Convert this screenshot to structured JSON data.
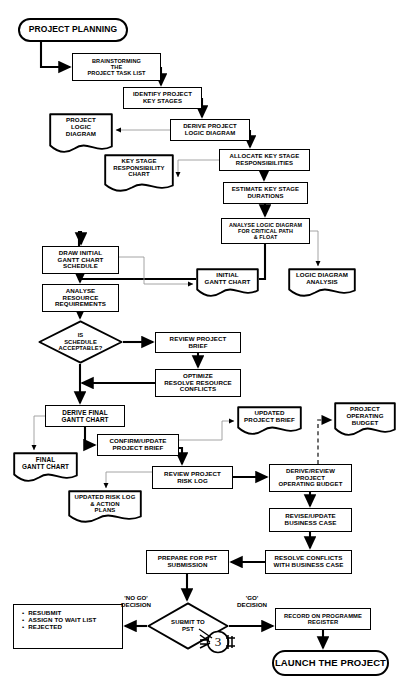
{
  "diagram": {
    "title": "PROJECT PLANNING",
    "type": "flowchart",
    "page_marker": "3",
    "header_faint": ""
  },
  "nodes": [
    {
      "id": "project-planning",
      "shape": "terminator",
      "label": "PROJECT PLANNING",
      "x": 18,
      "y": 18,
      "w": 110,
      "h": 24,
      "fs": 8.5
    },
    {
      "id": "brainstorming",
      "shape": "process",
      "label": "BRAINSTORMING\nTHE\nPROJECT TASK LIST",
      "x": 72,
      "y": 53,
      "w": 89,
      "h": 28,
      "fs": 5.6
    },
    {
      "id": "identify-key-stages",
      "shape": "process",
      "label": "IDENTIFY PROJECT\nKEY STAGES",
      "x": 123,
      "y": 87,
      "w": 79,
      "h": 22,
      "fs": 6.0
    },
    {
      "id": "derive-logic-diagram",
      "shape": "process",
      "label": "DERIVE PROJECT\nLOGIC DIAGRAM",
      "x": 170,
      "y": 119,
      "w": 80,
      "h": 22,
      "fs": 6.0
    },
    {
      "id": "project-logic-diagram",
      "shape": "document",
      "label": "PROJECT\nLOGIC\nDIAGRAM",
      "x": 49,
      "y": 113,
      "w": 64,
      "h": 44,
      "fs": 6.2
    },
    {
      "id": "allocate-responsibility",
      "shape": "process",
      "label": "ALLOCATE KEY STAGE\nRESPONSIBILITIES",
      "x": 219,
      "y": 149,
      "w": 91,
      "h": 22,
      "fs": 6.0
    },
    {
      "id": "key-stage-resp-chart",
      "shape": "document",
      "label": "KEY STAGE\nRESPONSIBILITY\nCHART",
      "x": 104,
      "y": 154,
      "w": 70,
      "h": 42,
      "fs": 6.0
    },
    {
      "id": "estimate-durations",
      "shape": "process",
      "label": "ESTIMATE KEY STAGE\nDURATIONS",
      "x": 223,
      "y": 182,
      "w": 85,
      "h": 22,
      "fs": 6.0
    },
    {
      "id": "analyse-logic-diagram",
      "shape": "process",
      "label": "ANALYSE LOGIC DIAGRAM\nFOR CRITICAL PATH\n&  FLOAT",
      "x": 221,
      "y": 218,
      "w": 89,
      "h": 26,
      "fs": 5.4
    },
    {
      "id": "draw-initial-gantt",
      "shape": "process",
      "label": "DRAW  INITIAL\nGANTT CHART\nSCHEDULE",
      "x": 42,
      "y": 246,
      "w": 77,
      "h": 28,
      "fs": 6.2
    },
    {
      "id": "analyse-resource-req",
      "shape": "process",
      "label": "ANALYSE\nRESOURCE\nREQUIREMENTS",
      "x": 42,
      "y": 284,
      "w": 77,
      "h": 28,
      "fs": 6.2
    },
    {
      "id": "initial-gantt-chart",
      "shape": "document",
      "label": "INITIAL\nGANTT CHART",
      "x": 196,
      "y": 268,
      "w": 63,
      "h": 33,
      "fs": 6.2
    },
    {
      "id": "logic-diagram-analysis",
      "shape": "document",
      "label": "LOGIC DIAGRAM\nANALYSIS",
      "x": 288,
      "y": 268,
      "w": 68,
      "h": 33,
      "fs": 6.2
    },
    {
      "id": "is-schedule-acceptable",
      "shape": "decision",
      "label": "IS\nSCHEDULE\nACCEPTABLE?",
      "x": 38,
      "y": 320,
      "w": 85,
      "h": 44,
      "fs": 5.8
    },
    {
      "id": "review-project-brief",
      "shape": "process",
      "label": "REVIEW PROJECT\nBRIEF",
      "x": 155,
      "y": 332,
      "w": 86,
      "h": 21,
      "fs": 6.2
    },
    {
      "id": "optimize-resolve",
      "shape": "process",
      "label": "OPTIMIZE\nRESOLVE RESOURCE\nCONFLICTS",
      "x": 155,
      "y": 369,
      "w": 86,
      "h": 28,
      "fs": 6.2
    },
    {
      "id": "derive-final-gantt",
      "shape": "process",
      "label": "DERIVE  FINAL\nGANTT CHART",
      "x": 45,
      "y": 405,
      "w": 80,
      "h": 22,
      "fs": 6.4
    },
    {
      "id": "final-gantt-chart",
      "shape": "document",
      "label": "FINAL\nGANTT CHART",
      "x": 13,
      "y": 452,
      "w": 65,
      "h": 34,
      "fs": 6.4
    },
    {
      "id": "confirm-update-brief",
      "shape": "process",
      "label": "CONFIRM/UPDATE\nPROJECT  BRIEF",
      "x": 97,
      "y": 434,
      "w": 82,
      "h": 22,
      "fs": 6.2
    },
    {
      "id": "updated-project-brief",
      "shape": "document",
      "label": "UPDATED\nPROJECT BRIEF",
      "x": 237,
      "y": 406,
      "w": 65,
      "h": 33,
      "fs": 6.2
    },
    {
      "id": "project-operating-budget",
      "shape": "document",
      "label": "PROJECT\nOPERATING\nBUDGET",
      "x": 334,
      "y": 402,
      "w": 62,
      "h": 38,
      "fs": 6.2
    },
    {
      "id": "review-risk-log",
      "shape": "process",
      "label": "REVIEW PROJECT\nRISK LOG",
      "x": 152,
      "y": 466,
      "w": 81,
      "h": 23,
      "fs": 6.2
    },
    {
      "id": "updated-risk-log",
      "shape": "document",
      "label": "UPDATED RISK LOG\n& ACTION\nPLANS",
      "x": 68,
      "y": 490,
      "w": 74,
      "h": 37,
      "fs": 6.0
    },
    {
      "id": "derive-review-budget",
      "shape": "process",
      "label": "DERIVE/REVIEW\nPROJECT\nOPERATING BUDGET",
      "x": 269,
      "y": 464,
      "w": 83,
      "h": 28,
      "fs": 6.0
    },
    {
      "id": "revise-business-case",
      "shape": "process",
      "label": "REVISE/UPDATE\nBUSINESS CASE",
      "x": 269,
      "y": 508,
      "w": 83,
      "h": 24,
      "fs": 6.2
    },
    {
      "id": "resolve-conflicts",
      "shape": "process",
      "label": "RESOLVE CONFLICTS\nWITH BUSINESS CASE",
      "x": 265,
      "y": 550,
      "w": 87,
      "h": 24,
      "fs": 6.2
    },
    {
      "id": "prepare-pst-submission",
      "shape": "process",
      "label": "PREPARE FOR PST\nSUBMISSION",
      "x": 146,
      "y": 550,
      "w": 83,
      "h": 24,
      "fs": 6.2
    },
    {
      "id": "submit-to-pst",
      "shape": "decision",
      "label": "SUBMIT TO\nPST",
      "x": 147,
      "y": 602,
      "w": 82,
      "h": 48,
      "fs": 6.0
    },
    {
      "id": "record-on-register",
      "shape": "process",
      "label": "RECORD ON PROGRAMME\nREGISTER",
      "x": 275,
      "y": 608,
      "w": 96,
      "h": 22,
      "fs": 5.8
    },
    {
      "id": "launch-the-project",
      "shape": "terminator",
      "label": "LAUNCH THE PROJECT",
      "x": 272,
      "y": 650,
      "w": 117,
      "h": 26,
      "fs": 9.5
    }
  ],
  "list_node": {
    "id": "no-go-outcomes",
    "x": 13,
    "y": 604,
    "w": 110,
    "h": 45,
    "fs": 6.2,
    "items": [
      "RESUBMIT",
      "ASSIGN TO WAIT LIST",
      "REJECTED"
    ]
  },
  "edge_labels": [
    {
      "id": "no-go-decision",
      "text": "'NO GO'\nDECISION",
      "x": 113,
      "y": 594,
      "w": 46,
      "fs": 6.2
    },
    {
      "id": "go-decision",
      "text": "'GO'\nDECISION",
      "x": 230,
      "y": 594,
      "w": 44,
      "fs": 6.2
    }
  ],
  "page_marker": {
    "id": "page-connector-3",
    "value": "3",
    "x": 198,
    "y": 627,
    "w": 40,
    "h": 30,
    "fs": 13
  },
  "colors": {
    "stroke": "#000000",
    "background": "#ffffff",
    "thin_connector": "#9a9a9a",
    "dashed_connector": "#555555"
  },
  "edges": [
    {
      "from": "project-planning",
      "to": "brainstorming",
      "style": "solid-heavy"
    },
    {
      "from": "brainstorming",
      "to": "identify-key-stages",
      "style": "solid-heavy"
    },
    {
      "from": "identify-key-stages",
      "to": "derive-logic-diagram",
      "style": "solid-heavy"
    },
    {
      "from": "derive-logic-diagram",
      "to": "project-logic-diagram",
      "style": "thin"
    },
    {
      "from": "derive-logic-diagram",
      "to": "allocate-responsibility",
      "style": "solid-heavy"
    },
    {
      "from": "allocate-responsibility",
      "to": "key-stage-resp-chart",
      "style": "thin"
    },
    {
      "from": "allocate-responsibility",
      "to": "estimate-durations",
      "style": "solid-heavy"
    },
    {
      "from": "estimate-durations",
      "to": "analyse-logic-diagram",
      "style": "solid-heavy"
    },
    {
      "from": "analyse-logic-diagram",
      "to": "draw-initial-gantt",
      "style": "solid-heavy"
    },
    {
      "from": "analyse-logic-diagram",
      "to": "logic-diagram-analysis",
      "style": "thin"
    },
    {
      "from": "draw-initial-gantt",
      "to": "initial-gantt-chart",
      "style": "thin"
    },
    {
      "from": "draw-initial-gantt",
      "to": "analyse-resource-req",
      "style": "solid-heavy"
    },
    {
      "from": "analyse-resource-req",
      "to": "is-schedule-acceptable",
      "style": "solid-heavy"
    },
    {
      "from": "is-schedule-acceptable",
      "to": "review-project-brief",
      "style": "solid-heavy"
    },
    {
      "from": "review-project-brief",
      "to": "optimize-resolve",
      "style": "solid-heavy"
    },
    {
      "from": "optimize-resolve",
      "to": "is-schedule-acceptable",
      "style": "solid-heavy"
    },
    {
      "from": "is-schedule-acceptable",
      "to": "derive-final-gantt",
      "style": "solid-heavy"
    },
    {
      "from": "derive-final-gantt",
      "to": "final-gantt-chart",
      "style": "thin"
    },
    {
      "from": "derive-final-gantt",
      "to": "confirm-update-brief",
      "style": "solid-heavy"
    },
    {
      "from": "confirm-update-brief",
      "to": "updated-project-brief",
      "style": "thin"
    },
    {
      "from": "confirm-update-brief",
      "to": "review-risk-log",
      "style": "solid-heavy"
    },
    {
      "from": "review-risk-log",
      "to": "updated-risk-log",
      "style": "thin"
    },
    {
      "from": "review-risk-log",
      "to": "derive-review-budget",
      "style": "solid-heavy"
    },
    {
      "from": "derive-review-budget",
      "to": "project-operating-budget",
      "style": "dashed"
    },
    {
      "from": "derive-review-budget",
      "to": "revise-business-case",
      "style": "solid-heavy"
    },
    {
      "from": "revise-business-case",
      "to": "resolve-conflicts",
      "style": "solid-heavy"
    },
    {
      "from": "resolve-conflicts",
      "to": "prepare-pst-submission",
      "style": "solid-heavy"
    },
    {
      "from": "prepare-pst-submission",
      "to": "submit-to-pst",
      "style": "solid-heavy"
    },
    {
      "from": "submit-to-pst",
      "to": "no-go-outcomes",
      "style": "solid-heavy",
      "label": "'NO GO' DECISION"
    },
    {
      "from": "submit-to-pst",
      "to": "record-on-register",
      "style": "solid-heavy",
      "label": "'GO' DECISION"
    },
    {
      "from": "record-on-register",
      "to": "launch-the-project",
      "style": "solid-heavy"
    }
  ]
}
